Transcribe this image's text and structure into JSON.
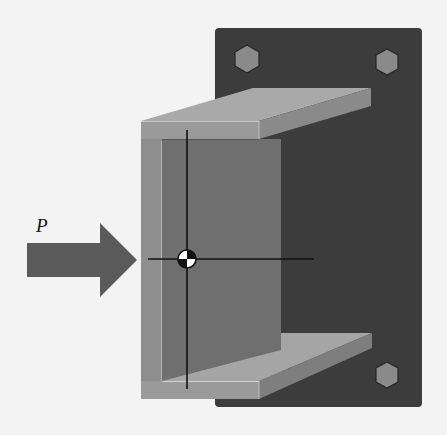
{
  "figure": {
    "load_label": "P",
    "colors": {
      "background": "#f3f3f3",
      "plate": "#3c3c3c",
      "bolt": "#8a8a8a",
      "bolt_edge": "#262626",
      "web_outer": "#8e8e8e",
      "web_inner": "#6f6f6f",
      "flange_top": "#a8a8a8",
      "flange_front": "#9a9a9a",
      "flange_side": "#7c7c7c",
      "arrow": "#5a5a5a",
      "axis_line": "#111111"
    }
  }
}
